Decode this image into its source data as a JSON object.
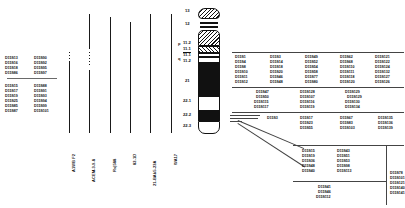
{
  "figure": {
    "type": "cytogenetic-ideogram-map"
  },
  "left_marker_block": {
    "col1_top": [
      "D15S13",
      "D15S16",
      "D15S18",
      "D15S86"
    ],
    "col2_top": [
      "D15S90",
      "D15S92",
      "D15S95",
      "D15S97"
    ],
    "col1_bottom": [
      "D15S15",
      "D15S17",
      "D15S19",
      "D15S25",
      "D15S85",
      "D15S87"
    ],
    "col2_bottom": [
      "D15S88",
      "D15S91",
      "D15S93",
      "D15S94",
      "D15S99",
      "D15S101"
    ]
  },
  "probes": [
    {
      "label": "A1WB F2",
      "x": 69,
      "top": 61,
      "height": 72,
      "dots_top": 52,
      "dots": 4
    },
    {
      "label": "ACEM-3-9-8",
      "x": 89,
      "top": 14,
      "height": 119,
      "dots_top": 52,
      "dots": 5
    },
    {
      "label": "Rs|588",
      "x": 110,
      "top": 17,
      "height": 116,
      "dots_top": 0,
      "dots": 0
    },
    {
      "label": "82-1D",
      "x": 130,
      "top": 22,
      "height": 111,
      "dots_top": 0,
      "dots": 0
    },
    {
      "label": "21-BAb5-23A",
      "x": 150,
      "top": 14,
      "height": 119,
      "dots_top": 0,
      "dots": 0
    },
    {
      "label": "WA17",
      "x": 171,
      "top": 14,
      "height": 119,
      "dots_top": 0,
      "dots": 0
    }
  ],
  "ideogram": {
    "band_labels": [
      {
        "text": "13",
        "y": 9
      },
      {
        "text": "12",
        "y": 22
      },
      {
        "text": "11.2",
        "y": 41
      },
      {
        "text": "11.1",
        "y": 48
      },
      {
        "text": "11.1",
        "y": 54
      },
      {
        "text": "11.2",
        "y": 60
      },
      {
        "text": "21",
        "y": 79
      },
      {
        "text": "22.1",
        "y": 99
      },
      {
        "text": "22.2",
        "y": 113
      },
      {
        "text": "22.3",
        "y": 124
      }
    ],
    "arm_marks": [
      {
        "text": "p",
        "y": 41
      },
      {
        "text": "q",
        "y": 57
      }
    ]
  },
  "panel_a": {
    "rows": [
      [
        "D15S1",
        "D15S3",
        "D15S49",
        "D15S62",
        "D15S121"
      ],
      [
        "D15S4",
        "D15S14",
        "D15S52",
        "D15S68",
        "D15S122"
      ],
      [
        "D15S8",
        "D15S18",
        "D15S54",
        "D15S110",
        "D15S124"
      ],
      [
        "D15S10",
        "D15S20",
        "D15S58",
        "D15S111",
        "D15S132"
      ],
      [
        "D15S11",
        "D15S46",
        "D15S77",
        "D15S118",
        "D15S127"
      ],
      [
        "D15S12",
        "D15S48",
        "D15S80",
        "D15S120",
        "D15S126"
      ]
    ]
  },
  "panel_b": {
    "rows": [
      [
        "D15S47",
        "D15S128",
        "D15S129"
      ],
      [
        "D15S50",
        "D15S107",
        "D15S129"
      ],
      [
        "D15S115",
        "D15S116",
        "D15S130"
      ],
      [
        "D15S117",
        "D15S119",
        "D15S134"
      ]
    ]
  },
  "panel_c": {
    "single": "D15S3",
    "rows": [
      [
        "D15S17",
        "D15S67",
        "D15S135"
      ],
      [
        "D15S23",
        "D15S83",
        "D15S136"
      ],
      [
        "D15S55",
        "D15S103",
        "D15S139"
      ]
    ]
  },
  "panel_d": {
    "col1": [
      "D15S15",
      "D15S19",
      "D15S36",
      "D15S48",
      "D15S40"
    ],
    "col2": [
      "D15S43",
      "D15S51",
      "D15S53",
      "D15S98",
      "D15S113"
    ]
  },
  "panel_e": {
    "col": [
      "D15S41",
      "D15S46",
      "D15S112"
    ]
  },
  "panel_f": {
    "col": [
      "D15S78",
      "D15S101",
      "D15S121",
      "D15S140",
      "D15S141"
    ]
  },
  "colors": {
    "ink": "#111111",
    "rule": "#444444",
    "background": "#ffffff"
  }
}
